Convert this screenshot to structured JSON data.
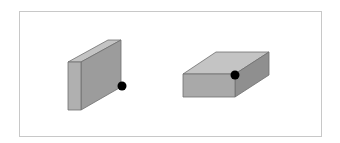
{
  "figure": {
    "frame_color": "#c8c8c8",
    "objects": [
      {
        "id": "upright-box",
        "orientation": "standing on edge (tall, thin)",
        "faces": {
          "front": "#a9a9a9",
          "top": "#c4c4c4",
          "side": "#9a9a9a"
        },
        "marker": {
          "color": "#000000",
          "position": "bottom-right corner of side face"
        }
      },
      {
        "id": "flat-box",
        "orientation": "lying flat (wide, short)",
        "faces": {
          "front": "#a9a9a9",
          "top": "#c4c4c4",
          "side": "#8f8f8f"
        },
        "marker": {
          "color": "#000000",
          "position": "top-right corner of front face"
        }
      }
    ]
  }
}
